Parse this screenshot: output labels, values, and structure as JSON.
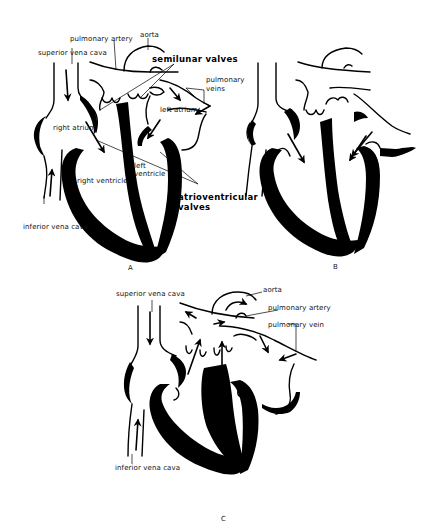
{
  "figure": {
    "panels": [
      {
        "id": "A",
        "letter": "A",
        "labels": {
          "aorta": "aorta",
          "pulmonary_artery": "pulmonary artery",
          "superior_vena_cava": "superior vena cava",
          "semilunar_valves": "semilunar valves",
          "pulmonary_veins_line1": "pulmonary",
          "pulmonary_veins_line2": "veins",
          "left_atrium": "left atrium",
          "right_atrium": "right atrium",
          "left_ventricle_line1": "left",
          "left_ventricle_line2": "ventricle",
          "right_ventricle": "right ventricle",
          "atrioventricular_valves_line1": "atrioventricular",
          "atrioventricular_valves_line2": "valves",
          "inferior_vena_cava": "inferior vena cava"
        }
      },
      {
        "id": "B",
        "letter": "B",
        "labels": {}
      },
      {
        "id": "C",
        "letter": "C",
        "labels": {
          "aorta": "aorta",
          "superior_vena_cava": "superior vena cava",
          "pulmonary_artery": "pulmonary artery",
          "pulmonary_vein": "pulmonary vein",
          "inferior_vena_cava": "inferior vena cava"
        }
      }
    ],
    "colors": {
      "ink": "#000000",
      "background": "#ffffff"
    }
  }
}
